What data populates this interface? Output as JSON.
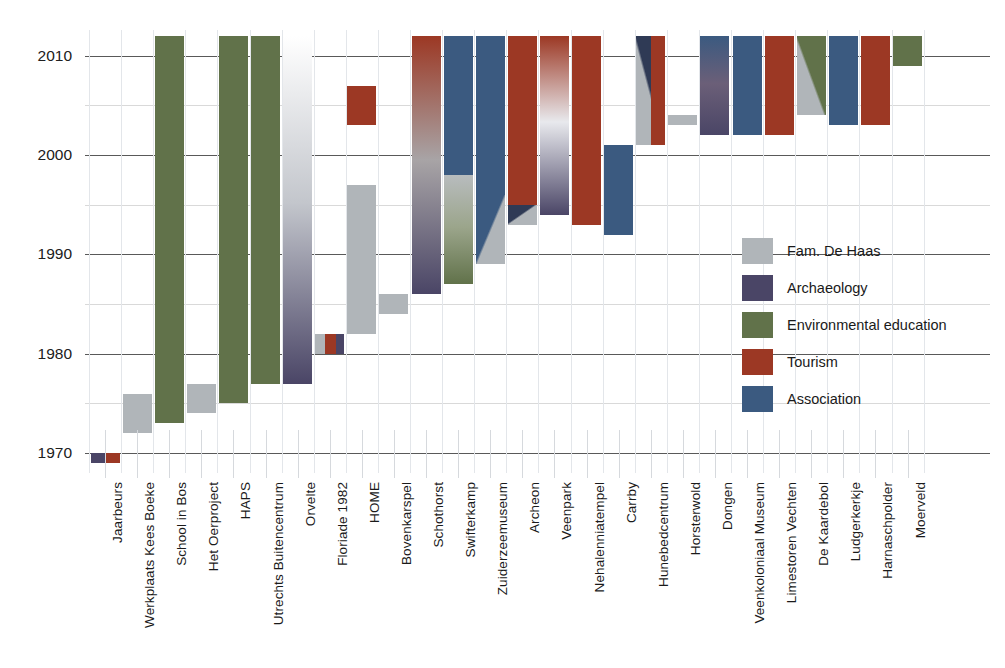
{
  "chart_data": {
    "type": "bar",
    "title": "",
    "xlabel": "",
    "ylabel": "",
    "ylim": [
      1968,
      2013
    ],
    "y_ticks": [
      1970,
      1980,
      1990,
      2000,
      2010
    ],
    "minor_ticks": [
      1975,
      1985,
      1995,
      2005
    ],
    "grid": true,
    "legend_position": "right-middle",
    "orientation": "vertical-timeline",
    "colors": {
      "fam_de_haas": "#b0b5b9",
      "archaeology": "#4a4566",
      "environmental_education": "#61724a",
      "tourism": "#9c3824",
      "association": "#3b5a80"
    },
    "legend": [
      {
        "label": "Fam. De Haas",
        "color": "#b0b5b9"
      },
      {
        "label": "Archaeology",
        "color": "#4a4566"
      },
      {
        "label": "Environmental education",
        "color": "#61724a"
      },
      {
        "label": "Tourism",
        "color": "#9c3824"
      },
      {
        "label": "Association",
        "color": "#3b5a80"
      }
    ],
    "categories": [
      "Jaarbeurs",
      "Werkplaats Kees Boeke",
      "School in Bos",
      "Het Oerproject",
      "HAPS",
      "Utrechts Buitencentrum",
      "Orvelte",
      "Floriade 1982",
      "HOME",
      "Bovenkarspel",
      "Schothorst",
      "Swifterkamp",
      "Zuiderzeemuseum",
      "Archeon",
      "Veenpark",
      "Nehalenniatempel",
      "Carrby",
      "Hunebedcentrum",
      "Horsterwold",
      "Dongen",
      "Veenkoloniaal Museum",
      "Limestoren Vechten",
      "De Kaardebol",
      "Ludgerkerkje",
      "Harnaschpolder",
      "Moerveld"
    ],
    "bars": [
      {
        "name": "Jaarbeurs",
        "start": 1969,
        "end": 1970,
        "segments": [
          {
            "from": 1969,
            "to": 1970,
            "fill": "split-h",
            "left": "#4a4566",
            "right": "#9c3824"
          }
        ]
      },
      {
        "name": "Werkplaats Kees Boeke",
        "start": 1972,
        "end": 1976,
        "segments": [
          {
            "from": 1972,
            "to": 1976,
            "fill": "solid",
            "color": "#b0b5b9"
          }
        ]
      },
      {
        "name": "School in Bos",
        "start": 1973,
        "end": 2012,
        "segments": [
          {
            "from": 1973,
            "to": 2012,
            "fill": "solid",
            "color": "#61724a"
          }
        ]
      },
      {
        "name": "Het Oerproject",
        "start": 1974,
        "end": 1977,
        "segments": [
          {
            "from": 1974,
            "to": 1977,
            "fill": "solid",
            "color": "#b0b5b9"
          }
        ]
      },
      {
        "name": "HAPS",
        "start": 1975,
        "end": 2012,
        "segments": [
          {
            "from": 1975,
            "to": 2012,
            "fill": "solid",
            "color": "#61724a"
          }
        ]
      },
      {
        "name": "Utrechts Buitencentrum",
        "start": 1977,
        "end": 2012,
        "segments": [
          {
            "from": 1977,
            "to": 2012,
            "fill": "solid",
            "color": "#61724a"
          }
        ]
      },
      {
        "name": "Orvelte",
        "start": 1977,
        "end": 2012,
        "segments": [
          {
            "from": 1977,
            "to": 2012,
            "fill": "gradient",
            "top": "#ffffff",
            "mid": "#c3c6cc",
            "bottom": "#4a4566"
          }
        ]
      },
      {
        "name": "Floriade 1982",
        "start": 1980,
        "end": 1982,
        "segments": [
          {
            "from": 1980,
            "to": 1982,
            "fill": "split-h3",
            "left": "#b0b5b9",
            "mid": "#9c3824",
            "right": "#4a4566"
          }
        ]
      },
      {
        "name": "HOME",
        "start": 1982,
        "end": 2007,
        "segments": [
          {
            "from": 1982,
            "to": 1997,
            "fill": "solid",
            "color": "#b0b5b9"
          },
          {
            "from": 2003,
            "to": 2007,
            "fill": "solid",
            "color": "#9c3824"
          }
        ]
      },
      {
        "name": "Bovenkarspel",
        "start": 1984,
        "end": 1986,
        "segments": [
          {
            "from": 1984,
            "to": 1986,
            "fill": "solid",
            "color": "#b0b5b9"
          }
        ]
      },
      {
        "name": "Schothorst",
        "start": 1986,
        "end": 2012,
        "segments": [
          {
            "from": 1986,
            "to": 2012,
            "fill": "gradient",
            "top": "#9c3824",
            "mid": "#a8a4a6",
            "bottom": "#4a4566"
          }
        ]
      },
      {
        "name": "Swifterkamp",
        "start": 1987,
        "end": 2012,
        "segments": [
          {
            "from": 1987,
            "to": 1998,
            "fill": "gradient",
            "top": "#b8bcbe",
            "mid": "#9ba58b",
            "bottom": "#61724a"
          },
          {
            "from": 1998,
            "to": 2012,
            "fill": "solid",
            "color": "#3b5a80"
          }
        ]
      },
      {
        "name": "Zuiderzeemuseum",
        "start": 1989,
        "end": 2012,
        "segments": [
          {
            "from": 1989,
            "to": 1996,
            "fill": "diag-blue-gray",
            "a": "#3b5a80",
            "b": "#b0b5b9"
          },
          {
            "from": 1996,
            "to": 2012,
            "fill": "solid",
            "color": "#3b5a80"
          }
        ]
      },
      {
        "name": "Archeon",
        "start": 1993,
        "end": 2012,
        "segments": [
          {
            "from": 1993,
            "to": 1995,
            "fill": "diag-navy-gray",
            "a": "#2f3a55",
            "b": "#b0b5b9"
          },
          {
            "from": 1995,
            "to": 2012,
            "fill": "solid",
            "color": "#9c3824"
          }
        ]
      },
      {
        "name": "Veenpark",
        "start": 1994,
        "end": 2012,
        "segments": [
          {
            "from": 1994,
            "to": 2012,
            "fill": "gradient",
            "top": "#9c3824",
            "mid": "#e8e9ed",
            "bottom": "#4a4566"
          }
        ]
      },
      {
        "name": "Nehalenniatempel",
        "start": 1993,
        "end": 2012,
        "segments": [
          {
            "from": 1993,
            "to": 2012,
            "fill": "solid",
            "color": "#9c3824"
          }
        ]
      },
      {
        "name": "Carrby",
        "start": 1992,
        "end": 2001,
        "segments": [
          {
            "from": 1992,
            "to": 2001,
            "fill": "solid",
            "color": "#3b5a80"
          }
        ]
      },
      {
        "name": "Hunebedcentrum",
        "start": 2001,
        "end": 2012,
        "segments": [
          {
            "from": 2001,
            "to": 2012,
            "fill": "diag-gray-navy",
            "a": "#b0b5b9",
            "b": "#2f3a55"
          },
          {
            "from": 2001,
            "to": 2012,
            "fill": "half-right-red",
            "color": "#9c3824"
          }
        ]
      },
      {
        "name": "Horsterwold",
        "start": 2003,
        "end": 2004,
        "segments": [
          {
            "from": 2003,
            "to": 2004,
            "fill": "solid",
            "color": "#b0b5b9"
          }
        ]
      },
      {
        "name": "Dongen",
        "start": 2002,
        "end": 2012,
        "segments": [
          {
            "from": 2002,
            "to": 2012,
            "fill": "gradient",
            "top": "#3b5a80",
            "mid": "#6b5f78",
            "bottom": "#4a4566"
          }
        ]
      },
      {
        "name": "Veenkoloniaal Museum",
        "start": 2002,
        "end": 2012,
        "segments": [
          {
            "from": 2002,
            "to": 2012,
            "fill": "solid",
            "color": "#3b5a80"
          }
        ]
      },
      {
        "name": "Limestoren Vechten",
        "start": 2002,
        "end": 2012,
        "segments": [
          {
            "from": 2002,
            "to": 2012,
            "fill": "solid",
            "color": "#9c3824"
          }
        ]
      },
      {
        "name": "De Kaardebol",
        "start": 2004,
        "end": 2012,
        "segments": [
          {
            "from": 2004,
            "to": 2012,
            "fill": "diag-gray-green",
            "a": "#b0b5b9",
            "b": "#61724a"
          }
        ]
      },
      {
        "name": "Ludgerkerkje",
        "start": 2003,
        "end": 2012,
        "segments": [
          {
            "from": 2003,
            "to": 2012,
            "fill": "solid",
            "color": "#3b5a80"
          }
        ]
      },
      {
        "name": "Harnaschpolder",
        "start": 2003,
        "end": 2012,
        "segments": [
          {
            "from": 2003,
            "to": 2012,
            "fill": "solid",
            "color": "#9c3824"
          }
        ]
      },
      {
        "name": "Moerveld",
        "start": 2009,
        "end": 2012,
        "segments": [
          {
            "from": 2009,
            "to": 2012,
            "fill": "solid",
            "color": "#61724a"
          }
        ]
      }
    ]
  }
}
